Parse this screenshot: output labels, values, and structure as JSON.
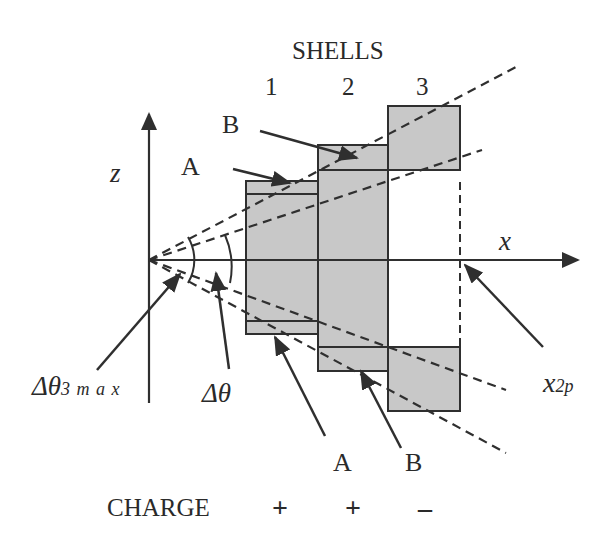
{
  "title": "SHELLS",
  "shells": [
    {
      "number": "1",
      "charge": "+"
    },
    {
      "number": "2",
      "charge": "+"
    },
    {
      "number": "3",
      "charge": "–"
    }
  ],
  "axes": {
    "z_label": "z",
    "x_label": "x"
  },
  "labels": {
    "a_top": "A",
    "b_top": "B",
    "a_bottom": "A",
    "b_bottom": "B",
    "dtheta3max_main": "Δθ",
    "dtheta3max_sub": "3 m a x",
    "dtheta": "Δθ",
    "x2p_main": "x",
    "x2p_sub": "2p",
    "charge_row": "CHARGE"
  },
  "colors": {
    "fill": "#c8c8c8",
    "stroke": "#2f2f2f",
    "text": "#2a2a2a"
  }
}
